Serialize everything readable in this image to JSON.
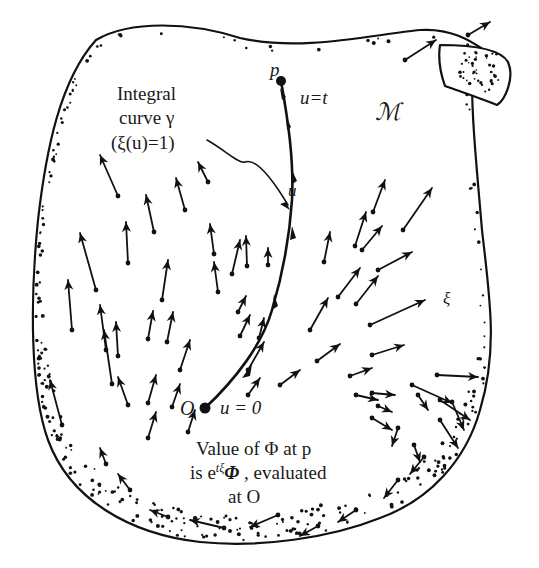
{
  "labels": {
    "integral_line1": "Integral",
    "integral_line2": "curve γ",
    "integral_line3": "(ξ(u)=1)",
    "p": "p",
    "u_eq_t": "u=t",
    "manifold": "ℳ",
    "u": "u",
    "xi": "ξ",
    "O": "O",
    "u_eq_0": "u = 0",
    "value_line1": "Value of Φ  at p",
    "value_line2": "is e",
    "value_line2_sup": "tξ",
    "value_line2_rest": "Φ, evaluated",
    "value_line3": "at O"
  },
  "colors": {
    "ink": "#111111",
    "paper": "#ffffff"
  },
  "points": {
    "p": [
      281,
      81
    ],
    "O": [
      205,
      408
    ]
  },
  "vectors": [
    [
      118,
      196,
      100,
      155
    ],
    [
      96,
      290,
      80,
      233
    ],
    [
      72,
      330,
      68,
      280
    ],
    [
      106,
      350,
      100,
      305
    ],
    [
      112,
      384,
      104,
      330
    ],
    [
      62,
      425,
      50,
      380
    ],
    [
      154,
      232,
      146,
      195
    ],
    [
      128,
      263,
      126,
      222
    ],
    [
      118,
      356,
      116,
      322
    ],
    [
      128,
      405,
      118,
      377
    ],
    [
      148,
      339,
      153,
      311
    ],
    [
      148,
      403,
      156,
      375
    ],
    [
      148,
      438,
      156,
      412
    ],
    [
      172,
      407,
      180,
      384
    ],
    [
      185,
      210,
      176,
      178
    ],
    [
      162,
      300,
      168,
      260
    ],
    [
      167,
      342,
      173,
      312
    ],
    [
      180,
      370,
      190,
      340
    ],
    [
      188,
      432,
      195,
      410
    ],
    [
      208,
      182,
      198,
      162
    ],
    [
      214,
      254,
      210,
      224
    ],
    [
      218,
      292,
      214,
      262
    ],
    [
      232,
      274,
      240,
      240
    ],
    [
      240,
      336,
      250,
      315
    ],
    [
      247,
      266,
      246,
      236
    ],
    [
      268,
      265,
      268,
      248
    ],
    [
      238,
      312,
      246,
      296
    ],
    [
      259,
      338,
      264,
      318
    ],
    [
      248,
      370,
      264,
      342
    ],
    [
      248,
      395,
      260,
      378
    ],
    [
      280,
      385,
      300,
      370
    ],
    [
      310,
      330,
      328,
      298
    ],
    [
      317,
      361,
      340,
      344
    ],
    [
      324,
      262,
      330,
      232
    ],
    [
      355,
      246,
      366,
      212
    ],
    [
      373,
      212,
      385,
      180
    ],
    [
      403,
      230,
      432,
      188
    ],
    [
      362,
      250,
      382,
      226
    ],
    [
      338,
      297,
      360,
      268
    ],
    [
      356,
      304,
      378,
      276
    ],
    [
      378,
      270,
      412,
      252
    ],
    [
      370,
      325,
      425,
      300
    ],
    [
      372,
      355,
      404,
      345
    ],
    [
      350,
      376,
      372,
      368
    ],
    [
      372,
      393,
      395,
      395
    ],
    [
      412,
      385,
      452,
      403
    ],
    [
      437,
      375,
      478,
      377
    ],
    [
      440,
      400,
      470,
      420
    ],
    [
      356,
      395,
      378,
      400
    ],
    [
      378,
      406,
      392,
      412
    ],
    [
      372,
      418,
      392,
      430
    ],
    [
      418,
      395,
      428,
      410
    ],
    [
      398,
      428,
      392,
      446
    ],
    [
      414,
      445,
      420,
      462
    ],
    [
      452,
      402,
      464,
      430
    ],
    [
      440,
      420,
      458,
      448
    ],
    [
      424,
      457,
      410,
      474
    ],
    [
      398,
      480,
      384,
      498
    ],
    [
      356,
      510,
      338,
      522
    ],
    [
      318,
      526,
      300,
      536
    ],
    [
      278,
      515,
      250,
      527
    ],
    [
      224,
      528,
      190,
      520
    ],
    [
      168,
      517,
      150,
      510
    ],
    [
      130,
      490,
      118,
      474
    ],
    [
      106,
      464,
      100,
      448
    ],
    [
      468,
      35,
      490,
      22
    ],
    [
      405,
      60,
      436,
      40
    ]
  ]
}
